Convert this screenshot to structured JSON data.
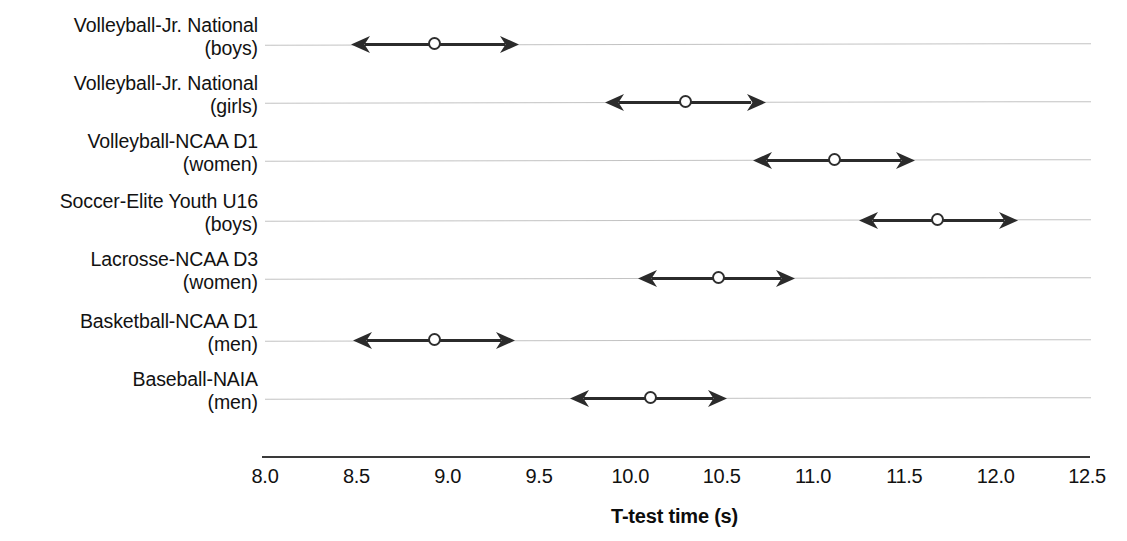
{
  "chart_data": {
    "type": "scatter",
    "title": "",
    "xlabel": "T-test time (s)",
    "ylabel": "",
    "xlim": [
      8.0,
      12.5
    ],
    "xticks": [
      "8.0",
      "8.5",
      "9.0",
      "9.5",
      "10.0",
      "10.5",
      "11.0",
      "11.5",
      "12.0",
      "12.5"
    ],
    "xtick_values": [
      8.0,
      8.5,
      9.0,
      9.5,
      10.0,
      10.5,
      11.0,
      11.5,
      12.0,
      12.5
    ],
    "grid": "horizontal",
    "legend": "none",
    "marker": "open-circle",
    "error_style": "double-headed-arrow",
    "categories": [
      {
        "line1": "Volleyball-Jr. National",
        "line2": "(boys)"
      },
      {
        "line1": "Volleyball-Jr. National",
        "line2": "(girls)"
      },
      {
        "line1": "Volleyball-NCAA D1",
        "line2": "(women)"
      },
      {
        "line1": "Soccer-Elite Youth U16",
        "line2": "(boys)"
      },
      {
        "line1": "Lacrosse-NCAA D3",
        "line2": "(women)"
      },
      {
        "line1": "Basketball-NCAA D1",
        "line2": "(men)"
      },
      {
        "line1": "Baseball-NAIA",
        "line2": "(men)"
      }
    ],
    "points": [
      {
        "category": "Volleyball-Jr. National (boys)",
        "value": 8.93,
        "low": 8.47,
        "high": 9.39
      },
      {
        "category": "Volleyball-Jr. National (girls)",
        "value": 10.3,
        "low": 9.86,
        "high": 10.74
      },
      {
        "category": "Volleyball-NCAA D1 (women)",
        "value": 11.12,
        "low": 10.67,
        "high": 11.56
      },
      {
        "category": "Soccer-Elite Youth U16 (boys)",
        "value": 11.68,
        "low": 11.25,
        "high": 12.12
      },
      {
        "category": "Lacrosse-NCAA D3 (women)",
        "value": 10.48,
        "low": 10.04,
        "high": 10.9
      },
      {
        "category": "Basketball-NCAA D1 (men)",
        "value": 8.93,
        "low": 8.48,
        "high": 9.37
      },
      {
        "category": "Baseball-NAIA (men)",
        "value": 10.11,
        "low": 9.67,
        "high": 10.53
      }
    ],
    "colors": {
      "marker_edge": "#2e2e2e",
      "marker_face": "#ffffff",
      "line": "#2b2b2b",
      "grid": "#b9b9b9",
      "axis": "#3a3a3a",
      "text": "#111111"
    }
  },
  "axis": {
    "title": "T-test time (s)"
  }
}
